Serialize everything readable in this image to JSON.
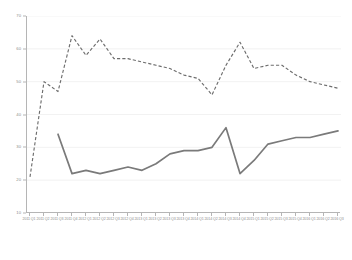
{
  "chart_data": {
    "type": "line",
    "title": "",
    "subtitle": "",
    "xlabel": "",
    "ylabel": "",
    "ylim": [
      10,
      70
    ],
    "yticks": [
      10,
      20,
      30,
      40,
      50,
      60,
      70
    ],
    "grid": true,
    "legend": "none",
    "categories": [
      "2011 Q1",
      "2011 Q2",
      "2011 Q3",
      "2011 Q4",
      "2012 Q1",
      "2012 Q2",
      "2012 Q3",
      "2012 Q4",
      "2013 Q1",
      "2013 Q2",
      "2013 Q3",
      "2013 Q4",
      "2014 Q1",
      "2014 Q2",
      "2014 Q3",
      "2014 Q4",
      "2015 Q1",
      "2015 Q2",
      "2015 Q3",
      "2015 Q4",
      "2016 Q1",
      "2016 Q2",
      "2016 Q3"
    ],
    "series": [
      {
        "name": "Series 1",
        "style": "dashed",
        "color": "#6d6d6d",
        "values": [
          21,
          50,
          47,
          64,
          58,
          63,
          57,
          57,
          56,
          55,
          54,
          52,
          51,
          46,
          55,
          62,
          54,
          55,
          55,
          52,
          50,
          49,
          48
        ]
      },
      {
        "name": "Series 2",
        "style": "solid",
        "color": "#7a7a7a",
        "values": [
          null,
          null,
          34,
          22,
          23,
          22,
          23,
          24,
          23,
          25,
          28,
          29,
          29,
          30,
          36,
          22,
          26,
          31,
          32,
          33,
          33,
          34,
          35
        ]
      }
    ]
  }
}
